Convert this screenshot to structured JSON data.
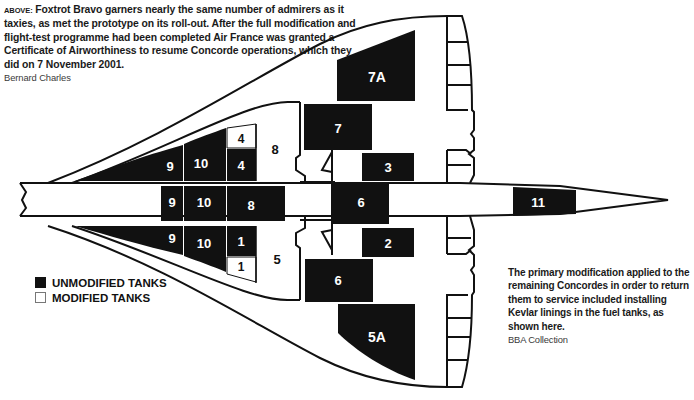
{
  "captions": {
    "top": {
      "lead": "Above:",
      "text": " Foxtrot Bravo garners nearly the same number of admirers as it taxies, as met the prototype on its roll-out. After the full modification and flight-test programme had been completed Air France was granted a Certificate of Airworthiness to resume Concorde operations, which they did on 7 November 2001.",
      "credit": "Bernard Charles"
    },
    "right": {
      "text": "The primary modification applied to the remaining Concordes in order to return them to service included installing Kevlar linings in the fuel tanks, as shown here.",
      "credit": "BBA Collection"
    }
  },
  "legend": {
    "items": [
      {
        "label": "UNMODIFIED TANKS",
        "color": "#111111"
      },
      {
        "label": "MODIFIED TANKS",
        "color": "#ffffff"
      }
    ]
  },
  "colors": {
    "unmodified": "#111111",
    "modified": "#ffffff",
    "outline": "#111111"
  },
  "tanks": {
    "t7a": "7A",
    "t7": "7",
    "t3": "3",
    "t6_center": "6",
    "t2": "2",
    "t6_lower": "6",
    "t5a": "5A",
    "t11": "11",
    "t9_upper": "9",
    "t10_upper": "10",
    "t4_upper_mod": "4",
    "t4_upper": "4",
    "t8_upper_mod": "8",
    "t9_mid": "9",
    "t10_mid": "10",
    "t8_mid": "8",
    "t9_lower": "9",
    "t10_lower": "10",
    "t1_lower": "1",
    "t1_lower_mod": "1",
    "t5_mod": "5"
  }
}
